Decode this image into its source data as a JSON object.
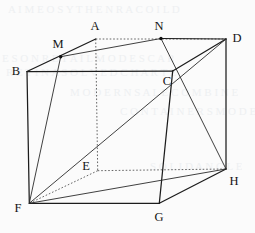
{
  "figure": {
    "width": 255,
    "height": 233,
    "background_color": "#fbfbfb",
    "line_color": "#1c1c1c",
    "hidden_line_color": "#4a4a4a",
    "label_color": "#141414"
  },
  "vertices": [
    {
      "id": "A",
      "label": "A",
      "x": 95.7,
      "y": 39.0,
      "label_x": 95,
      "label_y": 26,
      "hidden": true,
      "marked": false
    },
    {
      "id": "B",
      "label": "B",
      "x": 27.0,
      "y": 71.5,
      "label_x": 16,
      "label_y": 71,
      "hidden": false,
      "marked": false
    },
    {
      "id": "C",
      "label": "C",
      "x": 172.7,
      "y": 71.0,
      "label_x": 167,
      "label_y": 81,
      "hidden": false,
      "marked": false
    },
    {
      "id": "D",
      "label": "D",
      "x": 226.0,
      "y": 39.0,
      "label_x": 237,
      "label_y": 38,
      "hidden": false,
      "marked": false
    },
    {
      "id": "E",
      "label": "E",
      "x": 97.7,
      "y": 170.7,
      "label_x": 86,
      "label_y": 166,
      "hidden": true,
      "marked": false
    },
    {
      "id": "F",
      "label": "F",
      "x": 29.3,
      "y": 203.3,
      "label_x": 18,
      "label_y": 208,
      "hidden": false,
      "marked": false
    },
    {
      "id": "G",
      "label": "G",
      "x": 159.3,
      "y": 203.3,
      "label_x": 159,
      "label_y": 217,
      "hidden": false,
      "marked": false
    },
    {
      "id": "H",
      "label": "H",
      "x": 226.0,
      "y": 169.0,
      "label_x": 234,
      "label_y": 181,
      "hidden": false,
      "marked": false
    },
    {
      "id": "M",
      "label": "M",
      "x": 60.7,
      "y": 56.7,
      "label_x": 58,
      "label_y": 44,
      "hidden": false,
      "marked": true
    },
    {
      "id": "N",
      "label": "N",
      "x": 161.0,
      "y": 38.5,
      "label_x": 159,
      "label_y": 26,
      "hidden": false,
      "marked": true
    }
  ],
  "edges": [
    {
      "from": "B",
      "to": "A",
      "style": "solid",
      "name": "edge-BA"
    },
    {
      "from": "A",
      "to": "D",
      "style": "hidden",
      "name": "edge-AD"
    },
    {
      "from": "A",
      "to": "E",
      "style": "hidden",
      "name": "edge-AE"
    },
    {
      "from": "B",
      "to": "C",
      "style": "solid",
      "name": "edge-BC"
    },
    {
      "from": "C",
      "to": "D",
      "style": "solid",
      "name": "edge-CD"
    },
    {
      "from": "B",
      "to": "F",
      "style": "solid",
      "name": "edge-BF"
    },
    {
      "from": "C",
      "to": "G",
      "style": "solid",
      "name": "edge-CG"
    },
    {
      "from": "D",
      "to": "H",
      "style": "solid",
      "name": "edge-DH"
    },
    {
      "from": "F",
      "to": "G",
      "style": "solid",
      "name": "edge-FG"
    },
    {
      "from": "G",
      "to": "H",
      "style": "solid",
      "name": "edge-GH"
    },
    {
      "from": "E",
      "to": "F",
      "style": "hidden",
      "name": "edge-EF"
    },
    {
      "from": "E",
      "to": "H",
      "style": "hidden",
      "name": "edge-EH"
    }
  ],
  "construction_lines": [
    {
      "from": "M",
      "to": "N",
      "style": "thin",
      "name": "line-MN"
    },
    {
      "from": "N",
      "to": "D",
      "style": "solid",
      "name": "line-ND"
    },
    {
      "from": "M",
      "to": "F",
      "style": "thin",
      "name": "line-MF"
    },
    {
      "from": "N",
      "to": "H",
      "style": "thin",
      "name": "line-NH"
    },
    {
      "from": "F",
      "to": "H",
      "style": "thin",
      "name": "line-FH"
    },
    {
      "from": "D",
      "to": "F",
      "style": "thin",
      "name": "line-DF-partial"
    }
  ],
  "bleed_artifacts": [
    {
      "text": "A I M E O S Y T H E N R A C O I L D",
      "x": 8,
      "y": 3,
      "size": 11,
      "name": "bleed-line-1"
    },
    {
      "text": "E S O N R E T A I L M O D E S C A R",
      "x": 2,
      "y": 52,
      "size": 11,
      "name": "bleed-line-2"
    },
    {
      "text": "R E T I N A S O L V E D C H A R T E",
      "x": 6,
      "y": 66,
      "size": 11,
      "name": "bleed-line-3"
    },
    {
      "text": "M O D E R N S A L E C O M B I N E",
      "x": 70,
      "y": 86,
      "size": 11,
      "name": "bleed-line-4"
    },
    {
      "text": "C O N T A I N E R S M O D E L",
      "x": 120,
      "y": 105,
      "size": 11,
      "name": "bleed-line-5"
    },
    {
      "text": "S O L I D A N G L E",
      "x": 150,
      "y": 160,
      "size": 11,
      "name": "bleed-line-6"
    }
  ]
}
